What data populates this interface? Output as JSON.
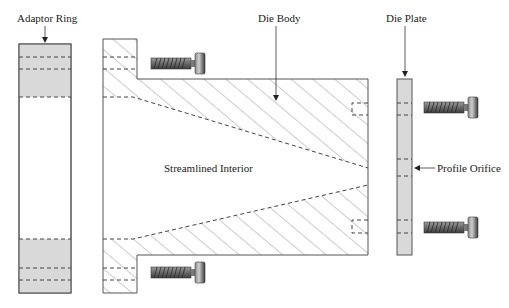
{
  "diagram": {
    "labels": {
      "adaptor_ring": "Adaptor Ring",
      "die_body": "Die Body",
      "die_plate": "Die Plate",
      "streamlined_interior": "Streamlined Interior",
      "profile_orifice": "Profile Orifice"
    },
    "components": [
      {
        "name": "Adaptor Ring",
        "fill": "#d9d9d9"
      },
      {
        "name": "Die Body",
        "fill": "hatched"
      },
      {
        "name": "Die Plate",
        "fill": "#d9d9d9"
      },
      {
        "name": "Bolts",
        "count": 4
      }
    ],
    "colors": {
      "outline": "#555555",
      "gray_fill": "#d9d9d9",
      "hatch": "#777777",
      "dash": "#444444",
      "bolt_dark": "#4a4a4a",
      "bolt_light": "#b0b0b0"
    }
  }
}
